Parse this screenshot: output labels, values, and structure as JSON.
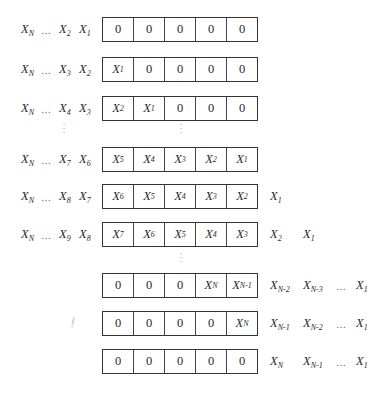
{
  "diagram": {
    "register_cells": 5,
    "vertical_ellipsis": "⋮",
    "rows": [
      {
        "input": {
          "xn": "X",
          "xn_sub": "N",
          "ell": "…",
          "a": "X",
          "a_sub": "2",
          "b": "X",
          "b_sub": "1"
        },
        "cells": [
          {
            "v": "0"
          },
          {
            "v": "0"
          },
          {
            "v": "0"
          },
          {
            "v": "0"
          },
          {
            "v": "0"
          }
        ],
        "output": []
      },
      {
        "input": {
          "xn": "X",
          "xn_sub": "N",
          "ell": "…",
          "a": "X",
          "a_sub": "3",
          "b": "X",
          "b_sub": "2"
        },
        "cells": [
          {
            "v": "X",
            "s": "1"
          },
          {
            "v": "0"
          },
          {
            "v": "0"
          },
          {
            "v": "0"
          },
          {
            "v": "0"
          }
        ],
        "output": []
      },
      {
        "input": {
          "xn": "X",
          "xn_sub": "N",
          "ell": "…",
          "a": "X",
          "a_sub": "4",
          "b": "X",
          "b_sub": "3"
        },
        "cells": [
          {
            "v": "X",
            "s": "2"
          },
          {
            "v": "X",
            "s": "1"
          },
          {
            "v": "0"
          },
          {
            "v": "0"
          },
          {
            "v": "0"
          }
        ],
        "output": []
      },
      {
        "input": {
          "xn": "X",
          "xn_sub": "N",
          "ell": "…",
          "a": "X",
          "a_sub": "7",
          "b": "X",
          "b_sub": "6"
        },
        "cells": [
          {
            "v": "X",
            "s": "5"
          },
          {
            "v": "X",
            "s": "4"
          },
          {
            "v": "X",
            "s": "3"
          },
          {
            "v": "X",
            "s": "2"
          },
          {
            "v": "X",
            "s": "1"
          }
        ],
        "output": []
      },
      {
        "input": {
          "xn": "X",
          "xn_sub": "N",
          "ell": "…",
          "a": "X",
          "a_sub": "8",
          "b": "X",
          "b_sub": "7"
        },
        "cells": [
          {
            "v": "X",
            "s": "6"
          },
          {
            "v": "X",
            "s": "5"
          },
          {
            "v": "X",
            "s": "4"
          },
          {
            "v": "X",
            "s": "3"
          },
          {
            "v": "X",
            "s": "2"
          }
        ],
        "output": [
          {
            "v": "X",
            "s": "1"
          }
        ]
      },
      {
        "input": {
          "xn": "X",
          "xn_sub": "N",
          "ell": "…",
          "a": "X",
          "a_sub": "9",
          "b": "X",
          "b_sub": "8"
        },
        "cells": [
          {
            "v": "X",
            "s": "7"
          },
          {
            "v": "X",
            "s": "6"
          },
          {
            "v": "X",
            "s": "5"
          },
          {
            "v": "X",
            "s": "4"
          },
          {
            "v": "X",
            "s": "3"
          }
        ],
        "output": [
          {
            "v": "X",
            "s": "2"
          },
          {
            "v": "X",
            "s": "1"
          }
        ]
      },
      {
        "input": null,
        "cells": [
          {
            "v": "0"
          },
          {
            "v": "0"
          },
          {
            "v": "0"
          },
          {
            "v": "X",
            "s": "N"
          },
          {
            "v": "X",
            "s": "N-1"
          }
        ],
        "output": [
          {
            "v": "X",
            "s": "N-2"
          },
          {
            "v": "X",
            "s": "N-3"
          },
          {
            "v": "…"
          },
          {
            "v": "X",
            "s": "1"
          }
        ]
      },
      {
        "input": null,
        "cells": [
          {
            "v": "0"
          },
          {
            "v": "0"
          },
          {
            "v": "0"
          },
          {
            "v": "0"
          },
          {
            "v": "X",
            "s": "N"
          }
        ],
        "output": [
          {
            "v": "X",
            "s": "N-1"
          },
          {
            "v": "X",
            "s": "N-2"
          },
          {
            "v": "…"
          },
          {
            "v": "X",
            "s": "1"
          }
        ]
      },
      {
        "input": null,
        "cells": [
          {
            "v": "0"
          },
          {
            "v": "0"
          },
          {
            "v": "0"
          },
          {
            "v": "0"
          },
          {
            "v": "0"
          }
        ],
        "output": [
          {
            "v": "X",
            "s": "N"
          },
          {
            "v": "X",
            "s": "N-1"
          },
          {
            "v": "…"
          },
          {
            "v": "X",
            "s": "1"
          }
        ]
      }
    ]
  }
}
